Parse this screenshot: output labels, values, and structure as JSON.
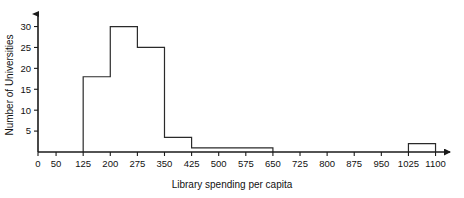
{
  "chart_data": {
    "type": "bar",
    "title": "",
    "xlabel": "Library spending per capita",
    "ylabel": "Number of Universities",
    "xlim": [
      0,
      1140
    ],
    "ylim": [
      0,
      33
    ],
    "grid": false,
    "legend": "none",
    "x_tick_labels": [
      "0",
      "50",
      "125",
      "200",
      "275",
      "350",
      "425",
      "500",
      "575",
      "650",
      "725",
      "800",
      "875",
      "950",
      "1025",
      "1100"
    ],
    "x_tick_values": [
      0,
      50,
      125,
      200,
      275,
      350,
      425,
      500,
      575,
      650,
      725,
      800,
      875,
      950,
      1025,
      1100
    ],
    "y_tick_labels": [
      "5",
      "10",
      "15",
      "20",
      "25",
      "30"
    ],
    "y_tick_values": [
      5,
      10,
      15,
      20,
      25,
      30
    ],
    "bin_edges": [
      125,
      200,
      275,
      350,
      425,
      500,
      575,
      650,
      1025,
      1100
    ],
    "bins": [
      {
        "start": 125,
        "end": 200,
        "value": 18
      },
      {
        "start": 200,
        "end": 275,
        "value": 30
      },
      {
        "start": 275,
        "end": 350,
        "value": 25
      },
      {
        "start": 350,
        "end": 425,
        "value": 3.5
      },
      {
        "start": 425,
        "end": 500,
        "value": 1
      },
      {
        "start": 500,
        "end": 575,
        "value": 1
      },
      {
        "start": 575,
        "end": 650,
        "value": 1
      },
      {
        "start": 1025,
        "end": 1100,
        "value": 2
      }
    ],
    "categories": [
      "125-200",
      "200-275",
      "275-350",
      "350-425",
      "425-500",
      "500-575",
      "575-650",
      "1025-1100"
    ],
    "values": [
      18,
      30,
      25,
      3.5,
      1,
      1,
      1,
      2
    ],
    "bar_fill": "#ffffff",
    "bar_stroke": "#2a2a2a",
    "axis_color": "#1a1a1a",
    "background": "#ffffff",
    "x_axis_arrow": true,
    "y_axis_arrow": true
  }
}
